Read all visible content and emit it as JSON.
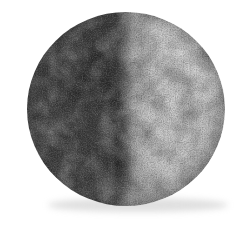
{
  "page": {
    "background_color": "#ffffff"
  },
  "moon": {
    "subject": "Grainy photograph of the Moon at half phase; left hemisphere in shadow, right hemisphere illuminated",
    "phase": "half (terminator vertical, dark side on left)",
    "colors": {
      "background": "#ffffff",
      "dark_core": "#3d3d3d",
      "dark_mid": "#474747",
      "dark_limb": "#5e5e5e",
      "dark_blotch": "#2e2e2e",
      "light_center": "#c6c6c6",
      "light_mid": "#b7b7b7",
      "light_limb": "#9c9c9c",
      "bright_patch": "#d2d2d2",
      "penumbra": "#6f6f6f",
      "drop_shadow": "#c6c6c6"
    }
  }
}
